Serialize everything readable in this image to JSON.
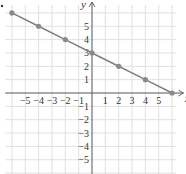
{
  "chart_data": {
    "type": "line",
    "title": "",
    "xlabel": "x",
    "ylabel": "y",
    "xlim": [
      -6.5,
      6.8
    ],
    "ylim": [
      -6,
      6.6
    ],
    "grid": true,
    "x_ticks": [
      "-5",
      "-4",
      "-3",
      "-2",
      "-1",
      "1",
      "2",
      "3",
      "4",
      "5"
    ],
    "y_ticks": [
      "5",
      "4",
      "3",
      "2",
      "1",
      "-1",
      "-2",
      "-3",
      "-4",
      "-5"
    ],
    "series": [
      {
        "name": "line",
        "equation": "y = -x/2 + 3",
        "x": [
          -6,
          -4,
          -2,
          0,
          2,
          4,
          6
        ],
        "y": [
          6,
          5,
          4,
          3,
          2,
          1,
          0
        ],
        "color": "#808080"
      }
    ],
    "colors": {
      "grid": "#d8d8d8",
      "axis": "#555555",
      "line": "#808080",
      "point": "#8a8a8a"
    }
  }
}
